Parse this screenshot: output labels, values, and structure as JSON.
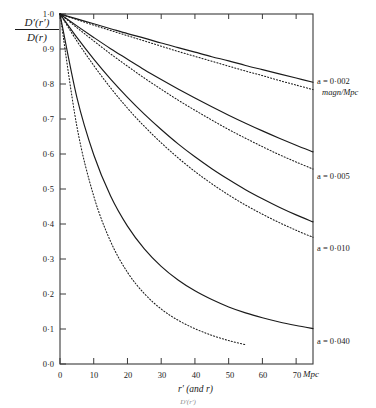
{
  "axes": {
    "ylabel_numerator": "D′(r′)",
    "ylabel_denominator": "D(r)",
    "xaxis_title": "r′ (and r)",
    "x_unit": "Mpc",
    "y_ticks": [
      "1·0",
      "0·9",
      "0·8",
      "0·7",
      "0·6",
      "0·5",
      "0·4",
      "0·3",
      "0·2",
      "0·1",
      "0·0"
    ],
    "y_tick_values": [
      1.0,
      0.9,
      0.8,
      0.7,
      0.6,
      0.5,
      0.4,
      0.3,
      0.2,
      0.1,
      0.0
    ],
    "x_ticks": [
      "0",
      "10",
      "20",
      "30",
      "40",
      "50",
      "60",
      "70"
    ],
    "x_tick_values": [
      0,
      10,
      20,
      30,
      40,
      50,
      60,
      70
    ]
  },
  "curve_labels": [
    {
      "text": "a = 0·002",
      "unit": "magn/Mpc"
    },
    {
      "text": "a = 0·005",
      "unit": ""
    },
    {
      "text": "a = 0·010",
      "unit": ""
    },
    {
      "text": "a = 0·040",
      "unit": ""
    }
  ],
  "bottom_caption": "D′(r′)",
  "colors": {
    "ink": "#1a1a1a",
    "axis": "#3a3a3a",
    "background": "#ffffff"
  },
  "chart_data": {
    "type": "line",
    "title": "",
    "xlabel": "r′ (and r)  [Mpc]",
    "ylabel": "D′(r′) / D(r)",
    "xlim": [
      0,
      75
    ],
    "ylim": [
      0.0,
      1.0
    ],
    "grid": false,
    "legend": "right-inline",
    "x": [
      0,
      5,
      10,
      15,
      20,
      25,
      30,
      35,
      40,
      45,
      50,
      55,
      60,
      65,
      70,
      75
    ],
    "series": [
      {
        "name": "a = 0·002 (solid)",
        "style": "solid",
        "a": 0.002,
        "values": [
          1.0,
          0.986,
          0.972,
          0.958,
          0.944,
          0.931,
          0.917,
          0.904,
          0.891,
          0.878,
          0.866,
          0.853,
          0.841,
          0.829,
          0.817,
          0.805
        ]
      },
      {
        "name": "a = 0·002 (dotted)",
        "style": "dotted",
        "a": 0.002,
        "values": [
          1.0,
          0.984,
          0.968,
          0.953,
          0.938,
          0.923,
          0.908,
          0.893,
          0.879,
          0.865,
          0.851,
          0.837,
          0.824,
          0.81,
          0.797,
          0.784
        ]
      },
      {
        "name": "a = 0·005 (solid)",
        "style": "solid",
        "a": 0.005,
        "values": [
          1.0,
          0.966,
          0.933,
          0.901,
          0.871,
          0.841,
          0.813,
          0.786,
          0.76,
          0.735,
          0.711,
          0.688,
          0.666,
          0.645,
          0.625,
          0.606
        ]
      },
      {
        "name": "a = 0·005 (dotted)",
        "style": "dotted",
        "a": 0.005,
        "values": [
          1.0,
          0.961,
          0.923,
          0.886,
          0.851,
          0.817,
          0.785,
          0.754,
          0.725,
          0.697,
          0.67,
          0.645,
          0.621,
          0.598,
          0.577,
          0.557
        ]
      },
      {
        "name": "a = 0·010 (solid)",
        "style": "solid",
        "a": 0.01,
        "values": [
          1.0,
          0.933,
          0.871,
          0.814,
          0.762,
          0.714,
          0.67,
          0.629,
          0.592,
          0.558,
          0.527,
          0.498,
          0.472,
          0.448,
          0.426,
          0.406
        ]
      },
      {
        "name": "a = 0·010 (dotted)",
        "style": "dotted",
        "a": 0.01,
        "values": [
          1.0,
          0.923,
          0.853,
          0.789,
          0.731,
          0.679,
          0.632,
          0.589,
          0.55,
          0.515,
          0.483,
          0.454,
          0.428,
          0.404,
          0.382,
          0.362
        ]
      },
      {
        "name": "a = 0·040 (solid)",
        "style": "solid",
        "a": 0.04,
        "values": [
          1.0,
          0.762,
          0.598,
          0.48,
          0.394,
          0.329,
          0.279,
          0.24,
          0.209,
          0.184,
          0.163,
          0.146,
          0.132,
          0.12,
          0.11,
          0.101
        ]
      },
      {
        "name": "a = 0·040 (dotted)",
        "style": "dotted",
        "a": 0.04,
        "values": [
          1.0,
          0.679,
          0.48,
          0.35,
          0.262,
          0.201,
          0.157,
          0.125,
          0.101,
          0.082,
          0.067,
          0.055,
          null,
          null,
          null,
          null
        ]
      }
    ]
  }
}
